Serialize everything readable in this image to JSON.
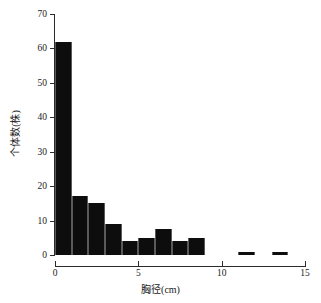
{
  "chart_data": {
    "type": "bar",
    "title": "",
    "subtitle": "",
    "xlabel": "胸径(cm)",
    "ylabel": "个体数(株)",
    "xlim": [
      0,
      15
    ],
    "ylim": [
      0,
      70
    ],
    "grid": false,
    "legend": null,
    "bar_color": "#0d0d0d",
    "axis_color": "#2b2b2b",
    "bin_width": 1,
    "x_tick_labels": [
      "0",
      "5",
      "10",
      "15"
    ],
    "x_tick_values": [
      0,
      5,
      10,
      15
    ],
    "y_tick_labels": [
      "0",
      "10",
      "20",
      "30",
      "40",
      "50",
      "60",
      "70"
    ],
    "y_tick_values": [
      0,
      10,
      20,
      30,
      40,
      50,
      60,
      70
    ],
    "categories": [
      "0-1",
      "1-2",
      "2-3",
      "3-4",
      "4-5",
      "5-6",
      "6-7",
      "7-8",
      "8-9",
      "9-10",
      "10-11",
      "11-12",
      "12-13",
      "13-14",
      "14-15"
    ],
    "bin_starts": [
      0,
      1,
      2,
      3,
      4,
      5,
      6,
      7,
      8,
      9,
      10,
      11,
      12,
      13,
      14
    ],
    "values": [
      62,
      17,
      15,
      9,
      4,
      5,
      7.5,
      4,
      5,
      0,
      0,
      1,
      0,
      1,
      0
    ]
  }
}
